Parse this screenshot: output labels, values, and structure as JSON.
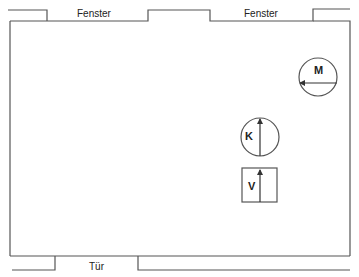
{
  "floorplan": {
    "windows": [
      {
        "label": "Fenster"
      },
      {
        "label": "Fenster"
      }
    ],
    "door": {
      "label": "Tür"
    },
    "symbols": [
      {
        "id": "M",
        "label": "M",
        "shape": "circle",
        "arrow": "left"
      },
      {
        "id": "K",
        "label": "K",
        "shape": "circle",
        "arrow": "up"
      },
      {
        "id": "V",
        "label": "V",
        "shape": "rectangle",
        "arrow": "up"
      }
    ],
    "colors": {
      "line": "#555555",
      "text": "#222222",
      "background": "#ffffff"
    }
  }
}
